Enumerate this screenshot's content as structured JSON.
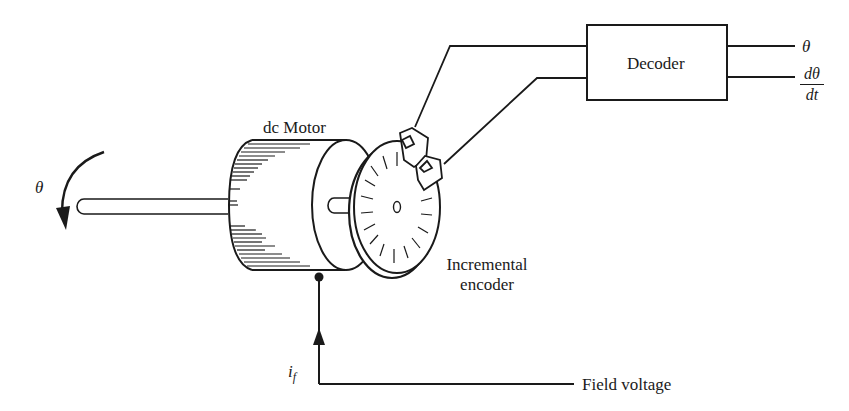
{
  "diagram": {
    "components": {
      "motor": {
        "label": "dc Motor"
      },
      "encoder": {
        "label_line1": "Incremental",
        "label_line2": "encoder"
      },
      "decoder": {
        "label": "Decoder"
      }
    },
    "signals": {
      "shaft_angle": "θ",
      "output_angle": "θ",
      "output_rate_num": "dθ",
      "output_rate_den": "dt",
      "field_current": "i",
      "field_current_sub": "f",
      "field_voltage": "Field voltage"
    },
    "colors": {
      "stroke": "#1a1a1a",
      "background": "#ffffff"
    }
  }
}
